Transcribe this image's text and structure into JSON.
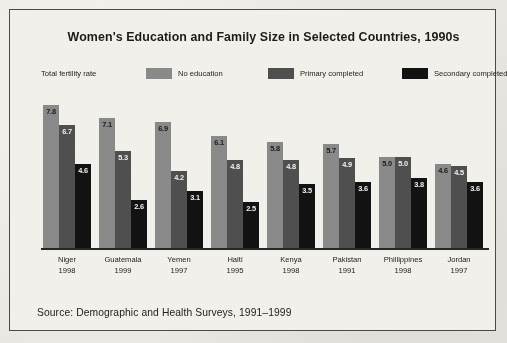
{
  "title": "Women's Education and Family Size in Selected Countries, 1990s",
  "legend": {
    "axis_note": "Total fertility rate",
    "items": [
      {
        "label": "No education",
        "color": "#8a8a8a"
      },
      {
        "label": "Primary completed",
        "color": "#4f4f4f"
      },
      {
        "label": "Secondary completed",
        "color": "#121212"
      }
    ]
  },
  "source": "Source: Demographic and Health Surveys, 1991–1999",
  "chart_data": {
    "type": "bar",
    "title": "Women's Education and Family Size in Selected Countries, 1990s",
    "xlabel": "",
    "ylabel": "Total fertility rate",
    "ylim": [
      0,
      8.2
    ],
    "grid": false,
    "legend_position": "top",
    "categories": [
      "Niger",
      "Guatemala",
      "Yemen",
      "Haiti",
      "Kenya",
      "Pakistan",
      "Phillippines",
      "Jordan"
    ],
    "category_years": [
      "1998",
      "1999",
      "1997",
      "1995",
      "1998",
      "1991",
      "1998",
      "1997"
    ],
    "series": [
      {
        "name": "No education",
        "color": "#8a8a8a",
        "values": [
          7.8,
          7.1,
          6.9,
          6.1,
          5.8,
          5.7,
          5.0,
          4.6
        ]
      },
      {
        "name": "Primary completed",
        "color": "#4f4f4f",
        "values": [
          6.7,
          5.3,
          4.2,
          4.8,
          4.8,
          4.9,
          5.0,
          4.5
        ]
      },
      {
        "name": "Secondary completed",
        "color": "#121212",
        "values": [
          4.6,
          2.6,
          3.1,
          2.5,
          3.5,
          3.6,
          3.8,
          3.6
        ]
      }
    ],
    "value_labels": [
      [
        "7.8",
        "6.7",
        "4.6"
      ],
      [
        "7.1",
        "5.3",
        "2.6"
      ],
      [
        "6.9",
        "4.2",
        "3.1"
      ],
      [
        "6.1",
        "4.8",
        "2.5"
      ],
      [
        "5.8",
        "4.8",
        "3.5"
      ],
      [
        "5.7",
        "4.9",
        "3.6"
      ],
      [
        "5.0",
        "5.0",
        "3.8"
      ],
      [
        "4.6",
        "4.5",
        "3.6"
      ]
    ]
  }
}
